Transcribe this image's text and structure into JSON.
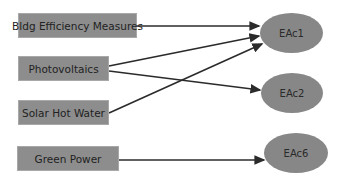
{
  "diagram": {
    "sources": [
      {
        "id": "bldg",
        "label": "Bldg Efficiency Measures"
      },
      {
        "id": "pv",
        "label": "Photovoltaics"
      },
      {
        "id": "shw",
        "label": "Solar Hot Water"
      },
      {
        "id": "green",
        "label": "Green Power"
      }
    ],
    "targets": [
      {
        "id": "eac1",
        "label": "EAc1"
      },
      {
        "id": "eac2",
        "label": "EAc2"
      },
      {
        "id": "eac6",
        "label": "EAc6"
      }
    ],
    "edges": [
      {
        "from": "Bldg Efficiency Measures",
        "to": "EAc1"
      },
      {
        "from": "Photovoltaics",
        "to": "EAc1"
      },
      {
        "from": "Photovoltaics",
        "to": "EAc2"
      },
      {
        "from": "Solar Hot Water",
        "to": "EAc1"
      },
      {
        "from": "Green Power",
        "to": "EAc6"
      }
    ],
    "colors": {
      "box_fill": "#8d8d8d",
      "ellipse_fill": "#878787",
      "arrow": "#2b2b2b"
    }
  }
}
